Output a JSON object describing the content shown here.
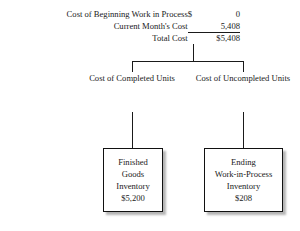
{
  "diagram": {
    "title_rows": [
      {
        "label": "Cost of Beginning Work in Process",
        "symbol": "$",
        "amount": "0"
      },
      {
        "label": "Current Month's Cost",
        "symbol": "",
        "amount": "5,408"
      },
      {
        "label": "Total Cost",
        "symbol": "",
        "amount": "$5,408"
      }
    ],
    "branches": [
      {
        "line1": "Cost of",
        "line2": "Completed",
        "line3": "Units"
      },
      {
        "line1": "Cost of",
        "line2": "Uncompleted",
        "line3": "Units"
      }
    ],
    "terminals": [
      {
        "line1": "Finished",
        "line2": "Goods",
        "line3": "Inventory",
        "amount": "$5,200"
      },
      {
        "line1": "Ending",
        "line2": "Work-in-Process",
        "line3": "Inventory",
        "amount": "$208"
      }
    ],
    "colors": {
      "ink": "#1a1a1a",
      "box_border": "#111111",
      "background": "#ffffff"
    }
  }
}
